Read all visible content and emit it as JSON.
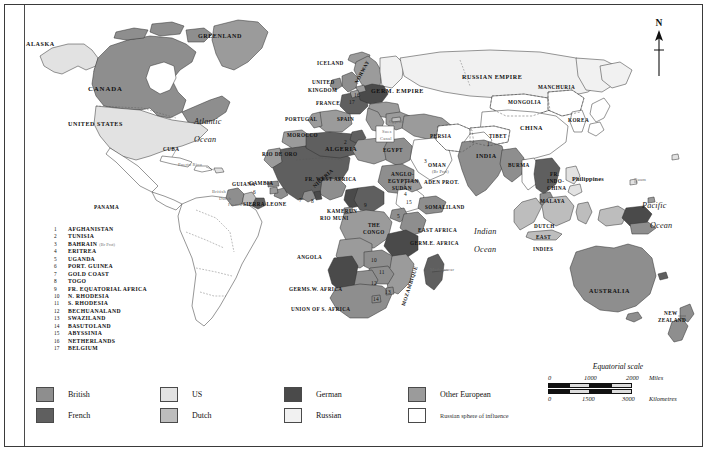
{
  "map": {
    "title_hidden": "",
    "north_arrow": {
      "letter": "N",
      "icon": "north-arrow-icon"
    },
    "oceans": [
      {
        "name": "Atlantic Ocean",
        "line1": "Atlantic",
        "line2": "Ocean",
        "x": 196,
        "y": 122
      },
      {
        "name": "Indian Ocean",
        "line1": "Indian",
        "line2": "Ocean",
        "x": 474,
        "y": 232
      },
      {
        "name": "Pacific Ocean",
        "line1": "Pacific",
        "line2": "Ocean",
        "x": 645,
        "y": 205
      }
    ],
    "labels": [
      {
        "text": "ALASKA",
        "x": 26,
        "y": 41,
        "cls": "caps"
      },
      {
        "text": "GREENLAND",
        "x": 198,
        "y": 33,
        "cls": "caps"
      },
      {
        "text": "CANADA",
        "x": 88,
        "y": 85,
        "cls": "caps-lg"
      },
      {
        "text": "UNITED STATES",
        "x": 68,
        "y": 121,
        "cls": "caps"
      },
      {
        "text": "CUBA",
        "x": 163,
        "y": 147,
        "cls": "caps-sm"
      },
      {
        "text": "Puerto Rico",
        "x": 178,
        "y": 163,
        "cls": "minor"
      },
      {
        "text": "PANAMA",
        "x": 94,
        "y": 205,
        "cls": "caps-sm"
      },
      {
        "text": "GUIANA",
        "x": 232,
        "y": 182,
        "cls": "caps-sm"
      },
      {
        "text": "British",
        "x": 212,
        "y": 190,
        "cls": "minor"
      },
      {
        "text": "Dutch",
        "x": 219,
        "y": 197,
        "cls": "minor"
      },
      {
        "text": "French",
        "x": 228,
        "y": 203,
        "cls": "minor"
      },
      {
        "text": "ICELAND",
        "x": 317,
        "y": 61,
        "cls": "caps-sm"
      },
      {
        "text": "UNITED",
        "x": 312,
        "y": 80,
        "cls": "caps-sm"
      },
      {
        "text": "KINGDOM",
        "x": 308,
        "y": 88,
        "cls": "caps-sm"
      },
      {
        "text": "FRANCE",
        "x": 316,
        "y": 101,
        "cls": "caps-sm"
      },
      {
        "text": "PORTUGAL",
        "x": 285,
        "y": 117,
        "cls": "caps-sm"
      },
      {
        "text": "SPAIN",
        "x": 337,
        "y": 117,
        "cls": "caps-sm"
      },
      {
        "text": "MOROCCO",
        "x": 287,
        "y": 133,
        "cls": "caps-sm"
      },
      {
        "text": "ALGERIA",
        "x": 325,
        "y": 146,
        "cls": "caps"
      },
      {
        "text": "RIO DE ORO",
        "x": 262,
        "y": 152,
        "cls": "caps-sm"
      },
      {
        "text": "GERM. EMPIRE",
        "x": 371,
        "y": 88,
        "cls": "caps"
      },
      {
        "text": "RUSSIAN EMPIRE",
        "x": 462,
        "y": 74,
        "cls": "caps"
      },
      {
        "text": "MONGOLIA",
        "x": 508,
        "y": 100,
        "cls": "caps-sm"
      },
      {
        "text": "MANCHURIA",
        "x": 538,
        "y": 85,
        "cls": "caps-sm"
      },
      {
        "text": "CHINA",
        "x": 520,
        "y": 125,
        "cls": "caps"
      },
      {
        "text": "KOREA",
        "x": 568,
        "y": 118,
        "cls": "caps-sm"
      },
      {
        "text": "TIBET",
        "x": 489,
        "y": 134,
        "cls": "caps-sm"
      },
      {
        "text": "INDIA",
        "x": 476,
        "y": 153,
        "cls": "caps"
      },
      {
        "text": "BURMA",
        "x": 508,
        "y": 163,
        "cls": "caps-sm"
      },
      {
        "text": "PERSIA",
        "x": 430,
        "y": 134,
        "cls": "caps-sm"
      },
      {
        "text": "OMAN",
        "x": 428,
        "y": 163,
        "cls": "caps-sm"
      },
      {
        "text": "(Br Prot)",
        "x": 432,
        "y": 170,
        "cls": "tiny-sub"
      },
      {
        "text": "ADEN PROT.",
        "x": 424,
        "y": 180,
        "cls": "caps-sm"
      },
      {
        "text": "EGYPT",
        "x": 383,
        "y": 148,
        "cls": "caps-sm"
      },
      {
        "text": "Suez",
        "x": 382,
        "y": 130,
        "cls": "minor"
      },
      {
        "text": "Canal",
        "x": 380,
        "y": 137,
        "cls": "minor"
      },
      {
        "text": "Cyprus",
        "x": 389,
        "y": 120,
        "cls": "minor"
      },
      {
        "text": "ANGLO-",
        "x": 391,
        "y": 172,
        "cls": "caps-sm"
      },
      {
        "text": "EGYPTIAN",
        "x": 388,
        "y": 179,
        "cls": "caps-sm"
      },
      {
        "text": "SUDAN",
        "x": 392,
        "y": 186,
        "cls": "caps-sm"
      },
      {
        "text": "FR. WEST AFRICA",
        "x": 305,
        "y": 177,
        "cls": "caps-sm"
      },
      {
        "text": "GAMBIA",
        "x": 249,
        "y": 181,
        "cls": "caps-sm"
      },
      {
        "text": "SIERRA LEONE",
        "x": 243,
        "y": 202,
        "cls": "caps-sm"
      },
      {
        "text": "KAMERUN",
        "x": 327,
        "y": 209,
        "cls": "caps-sm"
      },
      {
        "text": "RIO MUNI",
        "x": 320,
        "y": 216,
        "cls": "caps-sm"
      },
      {
        "text": "THE",
        "x": 368,
        "y": 223,
        "cls": "caps-sm"
      },
      {
        "text": "CONGO",
        "x": 363,
        "y": 230,
        "cls": "caps-sm"
      },
      {
        "text": "SOMALILAND",
        "x": 425,
        "y": 205,
        "cls": "caps-sm"
      },
      {
        "text": "EAST AFRICA",
        "x": 418,
        "y": 228,
        "cls": "caps-sm"
      },
      {
        "text": "GERM.E. AFRICA",
        "x": 410,
        "y": 241,
        "cls": "caps-sm"
      },
      {
        "text": "ANGOLA",
        "x": 297,
        "y": 255,
        "cls": "caps-sm"
      },
      {
        "text": "GERMS.W. AFRICA",
        "x": 289,
        "y": 287,
        "cls": "caps-sm"
      },
      {
        "text": "UNION OF S. AFRICA",
        "x": 291,
        "y": 307,
        "cls": "caps-sm"
      },
      {
        "text": "Madagascar",
        "x": 430,
        "y": 268,
        "cls": "minor"
      },
      {
        "text": "FR.",
        "x": 550,
        "y": 172,
        "cls": "caps-sm"
      },
      {
        "text": "INDO-",
        "x": 547,
        "y": 179,
        "cls": "caps-sm"
      },
      {
        "text": "CHINA",
        "x": 547,
        "y": 186,
        "cls": "caps-sm"
      },
      {
        "text": "Philippines",
        "x": 572,
        "y": 176,
        "cls": "mixed"
      },
      {
        "text": "Guam",
        "x": 634,
        "y": 178,
        "cls": "minor"
      },
      {
        "text": "MALAYA",
        "x": 540,
        "y": 199,
        "cls": "caps-sm"
      },
      {
        "text": "DUTCH",
        "x": 534,
        "y": 224,
        "cls": "caps-sm"
      },
      {
        "text": "EAST",
        "x": 536,
        "y": 235,
        "cls": "caps-sm"
      },
      {
        "text": "INDIES",
        "x": 533,
        "y": 247,
        "cls": "caps-sm"
      },
      {
        "text": "AUSTRALIA",
        "x": 589,
        "y": 288,
        "cls": "caps"
      },
      {
        "text": "NEW",
        "x": 664,
        "y": 311,
        "cls": "caps-sm"
      },
      {
        "text": "ZEALAND",
        "x": 658,
        "y": 318,
        "cls": "caps-sm"
      }
    ],
    "rotated_labels": [
      {
        "text": "NIGERIA",
        "x": 312,
        "y": 185,
        "rot": -42,
        "cls": "caps-sm"
      },
      {
        "text": "MOZAMBIQUE",
        "x": 401,
        "y": 305,
        "rot": -72,
        "cls": "caps-sm"
      },
      {
        "text": "NORWAY",
        "x": 354,
        "y": 82,
        "rot": -62,
        "cls": "caps-sm"
      }
    ],
    "map_numbers": [
      {
        "n": "1",
        "x": 487,
        "y": 142
      },
      {
        "n": "2",
        "x": 344,
        "y": 140
      },
      {
        "n": "3",
        "x": 424,
        "y": 159
      },
      {
        "n": "4",
        "x": 404,
        "y": 192
      },
      {
        "n": "5",
        "x": 397,
        "y": 214
      },
      {
        "n": "6",
        "x": 253,
        "y": 190
      },
      {
        "n": "7",
        "x": 299,
        "y": 198
      },
      {
        "n": "8",
        "x": 311,
        "y": 199
      },
      {
        "n": "9",
        "x": 364,
        "y": 203
      },
      {
        "n": "10",
        "x": 371,
        "y": 258
      },
      {
        "n": "11",
        "x": 379,
        "y": 270
      },
      {
        "n": "12",
        "x": 371,
        "y": 281
      },
      {
        "n": "13",
        "x": 385,
        "y": 290
      },
      {
        "n": "14",
        "x": 373,
        "y": 297
      },
      {
        "n": "15",
        "x": 406,
        "y": 200
      },
      {
        "n": "16",
        "x": 354,
        "y": 93
      },
      {
        "n": "17",
        "x": 349,
        "y": 100
      }
    ]
  },
  "index": {
    "title": "",
    "items": [
      {
        "num": "1",
        "name": "AFGHANISTAN",
        "sub": ""
      },
      {
        "num": "2",
        "name": "TUNISIA",
        "sub": ""
      },
      {
        "num": "3",
        "name": "BAHRAIN",
        "sub": "(Br Prot)"
      },
      {
        "num": "4",
        "name": "ERITREA",
        "sub": ""
      },
      {
        "num": "5",
        "name": "UGANDA",
        "sub": ""
      },
      {
        "num": "6",
        "name": "PORT. GUINEA",
        "sub": ""
      },
      {
        "num": "7",
        "name": "GOLD COAST",
        "sub": ""
      },
      {
        "num": "8",
        "name": "TOGO",
        "sub": ""
      },
      {
        "num": "9",
        "name": "FR. EQUATORIAL AFRICA",
        "sub": ""
      },
      {
        "num": "10",
        "name": "N. RHODESIA",
        "sub": ""
      },
      {
        "num": "11",
        "name": "S. RHODESIA",
        "sub": ""
      },
      {
        "num": "12",
        "name": "BECHUANALAND",
        "sub": ""
      },
      {
        "num": "13",
        "name": "SWAZILAND",
        "sub": ""
      },
      {
        "num": "14",
        "name": "BASUTOLAND",
        "sub": ""
      },
      {
        "num": "15",
        "name": "ABYSSINIA",
        "sub": ""
      },
      {
        "num": "16",
        "name": "NETHERLANDS",
        "sub": ""
      },
      {
        "num": "17",
        "name": "BELGIUM",
        "sub": ""
      }
    ]
  },
  "legend": {
    "columns": [
      {
        "x": 0,
        "entries": [
          {
            "label": "British",
            "color": "#8e8e8e",
            "small": false
          },
          {
            "label": "French",
            "color": "#5f5f5f",
            "small": false
          }
        ]
      },
      {
        "x": 124,
        "entries": [
          {
            "label": "US",
            "color": "#e2e2e2",
            "small": false
          },
          {
            "label": "Dutch",
            "color": "#bdbdbd",
            "small": false
          }
        ]
      },
      {
        "x": 248,
        "entries": [
          {
            "label": "German",
            "color": "#4a4a4a",
            "small": false
          },
          {
            "label": "Russian",
            "color": "#f1f1f1",
            "small": false
          }
        ]
      },
      {
        "x": 372,
        "entries": [
          {
            "label": "Other European",
            "color": "#9b9b9b",
            "small": false
          },
          {
            "label": "Russian sphere of influence",
            "color": "#ffffff",
            "small": true
          }
        ]
      }
    ]
  },
  "scale": {
    "title": "Equatorial scale",
    "miles": {
      "ticks": [
        "0",
        "1000",
        "2000"
      ],
      "unit": "Miles"
    },
    "kilometres": {
      "ticks": [
        "0",
        "1500",
        "3000"
      ],
      "unit": "Kilometres"
    }
  },
  "colors": {
    "british": "#8e8e8e",
    "french": "#5f5f5f",
    "german": "#4a4a4a",
    "us": "#e2e2e2",
    "dutch": "#bdbdbd",
    "russian": "#f1f1f1",
    "other_european": "#9b9b9b",
    "russian_sphere": "#ffffff",
    "ocean": "#ffffff",
    "outline": "#2e2e2e"
  }
}
